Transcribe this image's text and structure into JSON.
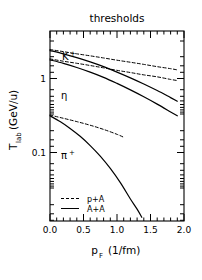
{
  "chart_data": {
    "type": "line",
    "title": "thresholds",
    "xlabel": "p_F  (1/fm)",
    "ylabel": "T_lab  (GeV/u)",
    "xlim": [
      0.0,
      2.0
    ],
    "ylim": [
      0.02,
      2.5
    ],
    "yscale": "log",
    "xscale": "linear",
    "grid": false,
    "xticks": [
      0.0,
      0.5,
      1.0,
      1.5,
      2.0
    ],
    "xticklabels": [
      "0.0",
      "0.5",
      "1.0",
      "1.5",
      "2.0"
    ],
    "yticks": [
      1,
      0.1
    ],
    "yticklabels": [
      "1",
      "0.1"
    ],
    "legend_position": "lower-left",
    "annotations": [
      {
        "text": "K",
        "sup": "+",
        "x": 0.25,
        "y": 1.62
      },
      {
        "text": "η",
        "sup": "",
        "x": 0.22,
        "y": 0.72
      },
      {
        "text": "π",
        "sup": "+",
        "x": 0.25,
        "y": 0.105
      }
    ],
    "series": [
      {
        "name": "K+ p+A",
        "style": "dashed",
        "particle": "K+",
        "reaction": "p+A",
        "x": [
          0.0,
          0.2,
          0.4,
          0.6,
          0.8,
          1.0,
          1.2,
          1.4,
          1.6,
          1.8,
          1.9
        ],
        "y": [
          1.56,
          1.48,
          1.4,
          1.33,
          1.26,
          1.19,
          1.13,
          1.07,
          1.01,
          0.96,
          0.93
        ]
      },
      {
        "name": "eta p+A",
        "style": "dashed",
        "particle": "eta",
        "reaction": "p+A",
        "x": [
          0.0,
          0.2,
          0.4,
          0.6,
          0.8,
          1.0,
          1.2,
          1.4,
          1.6,
          1.8,
          1.9
        ],
        "y": [
          1.23,
          1.16,
          1.1,
          1.04,
          0.98,
          0.92,
          0.87,
          0.82,
          0.78,
          0.73,
          0.71
        ]
      },
      {
        "name": "pi+ p+A",
        "style": "dashed",
        "particle": "pi+",
        "reaction": "p+A",
        "x": [
          0.0,
          0.2,
          0.4,
          0.6,
          0.8,
          1.0,
          1.1
        ],
        "y": [
          0.295,
          0.272,
          0.25,
          0.228,
          0.205,
          0.181,
          0.168
        ]
      },
      {
        "name": "K+ A+A",
        "style": "solid",
        "particle": "K+",
        "reaction": "A+A",
        "x": [
          0.0,
          0.2,
          0.4,
          0.6,
          0.8,
          1.0,
          1.2,
          1.4,
          1.6,
          1.8,
          1.9
        ],
        "y": [
          1.52,
          1.4,
          1.27,
          1.14,
          1.01,
          0.88,
          0.76,
          0.65,
          0.55,
          0.46,
          0.42
        ]
      },
      {
        "name": "eta A+A",
        "style": "solid",
        "particle": "eta",
        "reaction": "A+A",
        "x": [
          0.0,
          0.2,
          0.4,
          0.6,
          0.8,
          1.0,
          1.2,
          1.4,
          1.6,
          1.8,
          1.9
        ],
        "y": [
          1.2,
          1.1,
          0.99,
          0.88,
          0.77,
          0.66,
          0.56,
          0.47,
          0.39,
          0.32,
          0.29
        ]
      },
      {
        "name": "pi+ A+A",
        "style": "solid",
        "particle": "pi+",
        "reaction": "A+A",
        "x": [
          0.0,
          0.15,
          0.3,
          0.45,
          0.6,
          0.75,
          0.9,
          1.05,
          1.2,
          1.3,
          1.37
        ],
        "y": [
          0.29,
          0.25,
          0.21,
          0.172,
          0.136,
          0.104,
          0.076,
          0.053,
          0.035,
          0.027,
          0.022
        ]
      }
    ],
    "legend": [
      {
        "label": "p+A",
        "style": "dashed"
      },
      {
        "label": "A+A",
        "style": "solid"
      }
    ]
  },
  "axis": {
    "y_main": "T",
    "y_sub": "lab",
    "y_unit": "(GeV/u)",
    "x_main": "p",
    "x_sub": "F",
    "x_unit": "(1/fm)"
  }
}
